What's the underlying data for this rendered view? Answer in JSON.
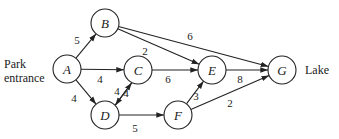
{
  "diagram": {
    "type": "directed-weighted-graph",
    "labels": {
      "start_line1": "Park",
      "start_line2": "entrance",
      "end": "Lake"
    },
    "nodes": [
      {
        "id": "A",
        "x": 67,
        "y": 69
      },
      {
        "id": "B",
        "x": 105,
        "y": 23
      },
      {
        "id": "C",
        "x": 138,
        "y": 70
      },
      {
        "id": "D",
        "x": 105,
        "y": 115
      },
      {
        "id": "E",
        "x": 212,
        "y": 70
      },
      {
        "id": "F",
        "x": 178,
        "y": 115
      },
      {
        "id": "G",
        "x": 282,
        "y": 70
      }
    ],
    "edges": [
      {
        "from": "A",
        "to": "B",
        "weight": "5",
        "lx": 77,
        "ly": 44
      },
      {
        "from": "A",
        "to": "C",
        "weight": "4",
        "lx": 100,
        "ly": 83
      },
      {
        "from": "A",
        "to": "D",
        "weight": "4",
        "lx": 74,
        "ly": 102
      },
      {
        "from": "B",
        "to": "E",
        "weight": "2",
        "lx": 145,
        "ly": 55
      },
      {
        "from": "B",
        "to": "G",
        "weight": "6",
        "lx": 190,
        "ly": 40
      },
      {
        "from": "C",
        "to": "E",
        "weight": "6",
        "lx": 168,
        "ly": 83
      },
      {
        "from": "C",
        "to": "D",
        "weight": "4",
        "lx": 117,
        "ly": 95
      },
      {
        "from": "D",
        "to": "C",
        "weight": "4",
        "lx": 126,
        "ly": 97
      },
      {
        "from": "D",
        "to": "F",
        "weight": "5",
        "lx": 135,
        "ly": 132
      },
      {
        "from": "E",
        "to": "G",
        "weight": "8",
        "lx": 240,
        "ly": 83
      },
      {
        "from": "F",
        "to": "E",
        "weight": "3",
        "lx": 196,
        "ly": 100
      },
      {
        "from": "F",
        "to": "G",
        "weight": "2",
        "lx": 230,
        "ly": 107
      }
    ]
  }
}
